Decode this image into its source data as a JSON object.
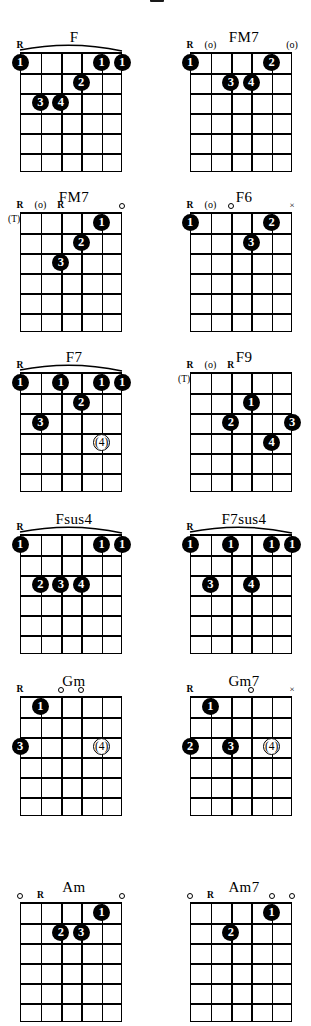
{
  "page": {
    "kind": "guitar-chord-chart",
    "columns": 2,
    "strings": 6,
    "frets": 6,
    "symbols": {
      "root": "R",
      "muted": "×",
      "open": "o",
      "open_parenthesized": "(o)",
      "thumb": "(T)"
    }
  },
  "chords": [
    {
      "name": "F",
      "column": "left",
      "row": 0,
      "barre": {
        "from_string": 6,
        "to_string": 1,
        "fret": 1
      },
      "top_markers": [
        {
          "string": 6,
          "type": "root",
          "label": "R"
        }
      ],
      "dots": [
        {
          "string": 6,
          "fret": 1,
          "finger": "1",
          "optional": false
        },
        {
          "string": 2,
          "fret": 1,
          "finger": "1",
          "optional": false
        },
        {
          "string": 1,
          "fret": 1,
          "finger": "1",
          "optional": false
        },
        {
          "string": 3,
          "fret": 2,
          "finger": "2",
          "optional": false
        },
        {
          "string": 5,
          "fret": 3,
          "finger": "3",
          "optional": false
        },
        {
          "string": 4,
          "fret": 3,
          "finger": "4",
          "optional": false
        }
      ]
    },
    {
      "name": "FM7",
      "column": "right",
      "row": 0,
      "barre": null,
      "top_markers": [
        {
          "string": 6,
          "type": "root",
          "label": "R"
        },
        {
          "string": 5,
          "type": "open_paren",
          "label": "(o)"
        },
        {
          "string": 1,
          "type": "open_paren",
          "label": "(o)"
        }
      ],
      "dots": [
        {
          "string": 6,
          "fret": 1,
          "finger": "1",
          "optional": false
        },
        {
          "string": 2,
          "fret": 1,
          "finger": "2",
          "optional": false
        },
        {
          "string": 4,
          "fret": 2,
          "finger": "3",
          "optional": false
        },
        {
          "string": 3,
          "fret": 2,
          "finger": "4",
          "optional": false
        }
      ]
    },
    {
      "name": "FM7",
      "column": "left",
      "row": 1,
      "barre": null,
      "thumb": "(T)",
      "top_markers": [
        {
          "string": 6,
          "type": "root",
          "label": "R"
        },
        {
          "string": 5,
          "type": "open_paren",
          "label": "(o)"
        },
        {
          "string": 4,
          "type": "root",
          "label": "R"
        },
        {
          "string": 1,
          "type": "open",
          "label": "o"
        }
      ],
      "dots": [
        {
          "string": 2,
          "fret": 1,
          "finger": "1",
          "optional": false
        },
        {
          "string": 3,
          "fret": 2,
          "finger": "2",
          "optional": false
        },
        {
          "string": 4,
          "fret": 3,
          "finger": "3",
          "optional": false
        }
      ]
    },
    {
      "name": "F6",
      "column": "right",
      "row": 1,
      "barre": null,
      "top_markers": [
        {
          "string": 6,
          "type": "root",
          "label": "R"
        },
        {
          "string": 5,
          "type": "open_paren",
          "label": "(o)"
        },
        {
          "string": 4,
          "type": "open",
          "label": "o"
        },
        {
          "string": 1,
          "type": "muted",
          "label": "×"
        }
      ],
      "dots": [
        {
          "string": 6,
          "fret": 1,
          "finger": "1",
          "optional": false
        },
        {
          "string": 2,
          "fret": 1,
          "finger": "2",
          "optional": false
        },
        {
          "string": 3,
          "fret": 2,
          "finger": "3",
          "optional": false
        }
      ]
    },
    {
      "name": "F7",
      "column": "left",
      "row": 2,
      "barre": {
        "from_string": 6,
        "to_string": 1,
        "fret": 1
      },
      "top_markers": [
        {
          "string": 6,
          "type": "root",
          "label": "R"
        }
      ],
      "dots": [
        {
          "string": 6,
          "fret": 1,
          "finger": "1",
          "optional": false
        },
        {
          "string": 4,
          "fret": 1,
          "finger": "1",
          "optional": false
        },
        {
          "string": 2,
          "fret": 1,
          "finger": "1",
          "optional": false
        },
        {
          "string": 1,
          "fret": 1,
          "finger": "1",
          "optional": false
        },
        {
          "string": 3,
          "fret": 2,
          "finger": "2",
          "optional": false
        },
        {
          "string": 5,
          "fret": 3,
          "finger": "3",
          "optional": false
        },
        {
          "string": 2,
          "fret": 4,
          "finger": "4",
          "optional": true
        }
      ]
    },
    {
      "name": "F9",
      "column": "right",
      "row": 2,
      "barre": null,
      "thumb": "(T)",
      "top_markers": [
        {
          "string": 6,
          "type": "root",
          "label": "R"
        },
        {
          "string": 5,
          "type": "open_paren",
          "label": "(o)"
        },
        {
          "string": 4,
          "type": "root",
          "label": "R"
        }
      ],
      "dots": [
        {
          "string": 3,
          "fret": 2,
          "finger": "1",
          "optional": false
        },
        {
          "string": 4,
          "fret": 3,
          "finger": "2",
          "optional": false
        },
        {
          "string": 1,
          "fret": 3,
          "finger": "3",
          "optional": false
        },
        {
          "string": 2,
          "fret": 4,
          "finger": "4",
          "optional": false
        }
      ]
    },
    {
      "name": "Fsus4",
      "column": "left",
      "row": 3,
      "barre": {
        "from_string": 6,
        "to_string": 1,
        "fret": 1
      },
      "top_markers": [
        {
          "string": 6,
          "type": "root",
          "label": "R"
        }
      ],
      "dots": [
        {
          "string": 6,
          "fret": 1,
          "finger": "1",
          "optional": false
        },
        {
          "string": 2,
          "fret": 1,
          "finger": "1",
          "optional": false
        },
        {
          "string": 1,
          "fret": 1,
          "finger": "1",
          "optional": false
        },
        {
          "string": 5,
          "fret": 3,
          "finger": "2",
          "optional": false
        },
        {
          "string": 4,
          "fret": 3,
          "finger": "3",
          "optional": false
        },
        {
          "string": 3,
          "fret": 3,
          "finger": "4",
          "optional": false
        }
      ]
    },
    {
      "name": "F7sus4",
      "column": "right",
      "row": 3,
      "barre": {
        "from_string": 6,
        "to_string": 1,
        "fret": 1
      },
      "top_markers": [
        {
          "string": 6,
          "type": "root",
          "label": "R"
        }
      ],
      "dots": [
        {
          "string": 6,
          "fret": 1,
          "finger": "1",
          "optional": false
        },
        {
          "string": 4,
          "fret": 1,
          "finger": "1",
          "optional": false
        },
        {
          "string": 2,
          "fret": 1,
          "finger": "1",
          "optional": false
        },
        {
          "string": 1,
          "fret": 1,
          "finger": "1",
          "optional": false
        },
        {
          "string": 5,
          "fret": 3,
          "finger": "3",
          "optional": false
        },
        {
          "string": 3,
          "fret": 3,
          "finger": "4",
          "optional": false
        }
      ]
    },
    {
      "name": "Gm",
      "column": "left",
      "row": 4,
      "barre": null,
      "top_markers": [
        {
          "string": 6,
          "type": "root",
          "label": "R"
        },
        {
          "string": 4,
          "type": "open",
          "label": "o"
        },
        {
          "string": 3,
          "type": "open",
          "label": "o"
        }
      ],
      "dots": [
        {
          "string": 5,
          "fret": 1,
          "finger": "1",
          "optional": false
        },
        {
          "string": 6,
          "fret": 3,
          "finger": "3",
          "optional": false
        },
        {
          "string": 2,
          "fret": 3,
          "finger": "4",
          "optional": true
        }
      ]
    },
    {
      "name": "Gm7",
      "column": "right",
      "row": 4,
      "barre": null,
      "top_markers": [
        {
          "string": 6,
          "type": "root",
          "label": "R"
        },
        {
          "string": 3,
          "type": "open",
          "label": "o"
        },
        {
          "string": 1,
          "type": "muted",
          "label": "×"
        }
      ],
      "dots": [
        {
          "string": 5,
          "fret": 1,
          "finger": "1",
          "optional": false
        },
        {
          "string": 6,
          "fret": 3,
          "finger": "2",
          "optional": false
        },
        {
          "string": 4,
          "fret": 3,
          "finger": "3",
          "optional": false
        },
        {
          "string": 2,
          "fret": 3,
          "finger": "4",
          "optional": true
        }
      ]
    },
    {
      "name": "Am",
      "column": "left",
      "row": 5,
      "barre": null,
      "top_markers": [
        {
          "string": 6,
          "type": "open",
          "label": "o"
        },
        {
          "string": 5,
          "type": "root",
          "label": "R"
        },
        {
          "string": 1,
          "type": "open",
          "label": "o"
        }
      ],
      "dots": [
        {
          "string": 2,
          "fret": 1,
          "finger": "1",
          "optional": false
        },
        {
          "string": 4,
          "fret": 2,
          "finger": "2",
          "optional": false
        },
        {
          "string": 3,
          "fret": 2,
          "finger": "3",
          "optional": false
        }
      ]
    },
    {
      "name": "Am7",
      "column": "right",
      "row": 5,
      "barre": null,
      "top_markers": [
        {
          "string": 6,
          "type": "open",
          "label": "o"
        },
        {
          "string": 5,
          "type": "root",
          "label": "R"
        },
        {
          "string": 2,
          "type": "open",
          "label": "o"
        },
        {
          "string": 1,
          "type": "open",
          "label": "o"
        }
      ],
      "dots": [
        {
          "string": 2,
          "fret": 1,
          "finger": "1",
          "optional": false
        },
        {
          "string": 4,
          "fret": 2,
          "finger": "2",
          "optional": false
        }
      ]
    }
  ]
}
